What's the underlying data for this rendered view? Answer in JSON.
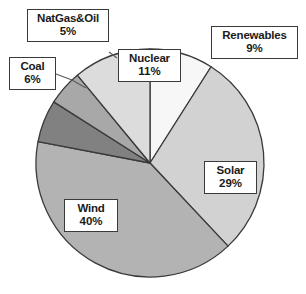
{
  "chart_data": {
    "type": "pie",
    "title": "",
    "categories": [
      "Renewables",
      "Solar",
      "Wind",
      "Coal",
      "NatGas&Oil",
      "Nuclear"
    ],
    "values": [
      9,
      29,
      40,
      6,
      5,
      11
    ],
    "unit": "%",
    "legend_position": "none",
    "labels_mode": "callout-boxes-with-leader-lines",
    "slices": [
      {
        "name": "Renewables",
        "value": 9,
        "percent_text": "9%",
        "color": "#f7f7f7",
        "start_angle_deg": 0,
        "end_angle_deg": 32.4
      },
      {
        "name": "Solar",
        "value": 29,
        "percent_text": "29%",
        "color": "#d2d2d2",
        "start_angle_deg": 32.4,
        "end_angle_deg": 136.8
      },
      {
        "name": "Wind",
        "value": 40,
        "percent_text": "40%",
        "color": "#b3b3b3",
        "start_angle_deg": 136.8,
        "end_angle_deg": 280.8
      },
      {
        "name": "Coal",
        "value": 6,
        "percent_text": "6%",
        "color": "#818181",
        "start_angle_deg": 280.8,
        "end_angle_deg": 302.4
      },
      {
        "name": "NatGas&Oil",
        "value": 5,
        "percent_text": "5%",
        "color": "#a8a8a8",
        "start_angle_deg": 302.4,
        "end_angle_deg": 320.4
      },
      {
        "name": "Nuclear",
        "value": 11,
        "percent_text": "11%",
        "color": "#dcdcdc",
        "start_angle_deg": 320.4,
        "end_angle_deg": 360
      }
    ],
    "outline_color": "#3a3a3a",
    "background_color": "#ffffff"
  },
  "callouts": {
    "natgas": {
      "label": "NatGas&Oil",
      "percent": "5%"
    },
    "coal": {
      "label": "Coal",
      "percent": "6%"
    },
    "nuclear": {
      "label": "Nuclear",
      "percent": "11%"
    },
    "renewables": {
      "label": "Renewables",
      "percent": "9%"
    },
    "solar": {
      "label": "Solar",
      "percent": "29%"
    },
    "wind": {
      "label": "Wind",
      "percent": "40%"
    }
  }
}
